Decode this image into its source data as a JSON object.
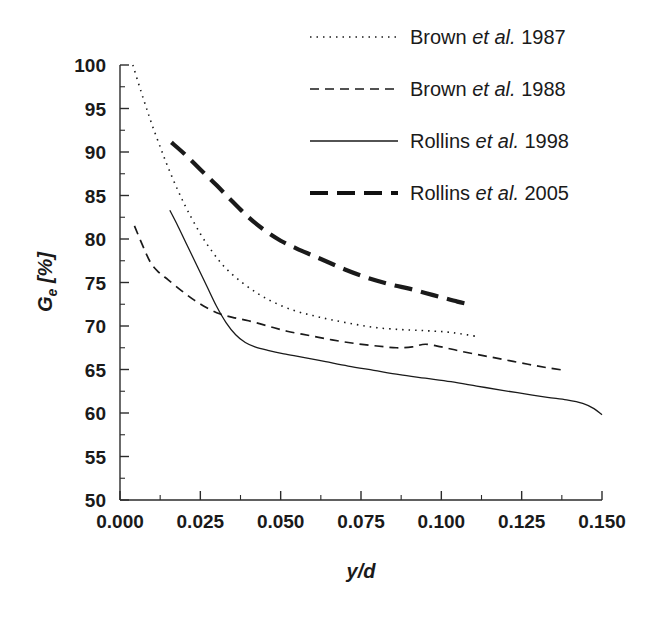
{
  "figure": {
    "width": 666,
    "height": 620,
    "background": "#ffffff",
    "ink_color": "#1a1a1a"
  },
  "chart_data": {
    "type": "line",
    "title": "",
    "subtitle": "",
    "xlabel": "y/d",
    "xlabel_parts": {
      "variable1": "y",
      "separator": "/",
      "variable2": "d"
    },
    "ylabel": "Ge [%]",
    "ylabel_parts": {
      "symbol": "G",
      "subscript": "e",
      "unit": "[%]"
    },
    "xlim": [
      0.0,
      0.15
    ],
    "ylim": [
      50,
      100
    ],
    "xticks": [
      0.0,
      0.025,
      0.05,
      0.075,
      0.1,
      0.125,
      0.15
    ],
    "xtick_labels": [
      "0.000",
      "0.025",
      "0.050",
      "0.075",
      "0.100",
      "0.125",
      "0.150"
    ],
    "x_minor_step": 0.0125,
    "yticks": [
      50,
      55,
      60,
      65,
      70,
      75,
      80,
      85,
      90,
      95,
      100
    ],
    "ytick_labels": [
      "50",
      "55",
      "60",
      "65",
      "70",
      "75",
      "80",
      "85",
      "90",
      "95",
      "100"
    ],
    "y_minor_step": 2.5,
    "grid": false,
    "legend_position": "top-right",
    "series": [
      {
        "name": "Brown et al. 1987",
        "label_prefix": "Brown ",
        "label_italic": "et al.",
        "label_suffix": " 1987",
        "style": "dotted",
        "color": "#1a1a1a",
        "width": 1.6,
        "dasharray": "1.5,5",
        "x": [
          0.004,
          0.006,
          0.008,
          0.01,
          0.0125,
          0.015,
          0.018,
          0.021,
          0.025,
          0.029,
          0.033,
          0.038,
          0.043,
          0.048,
          0.054,
          0.06,
          0.066,
          0.073,
          0.08,
          0.087,
          0.093,
          0.098,
          0.102,
          0.106,
          0.111
        ],
        "y": [
          100.0,
          97.6,
          95.3,
          93.1,
          90.6,
          88.2,
          85.6,
          83.3,
          80.6,
          78.4,
          76.6,
          75.0,
          73.7,
          72.7,
          71.8,
          71.2,
          70.7,
          70.2,
          69.8,
          69.6,
          69.5,
          69.4,
          69.3,
          69.1,
          68.8
        ]
      },
      {
        "name": "Brown et al. 1988",
        "label_prefix": "Brown ",
        "label_italic": "et al.",
        "label_suffix": " 1988",
        "style": "dashed",
        "color": "#1a1a1a",
        "width": 1.7,
        "dasharray": "9,6",
        "x": [
          0.0045,
          0.007,
          0.0095,
          0.012,
          0.015,
          0.019,
          0.023,
          0.027,
          0.031,
          0.035,
          0.04,
          0.046,
          0.052,
          0.059,
          0.066,
          0.073,
          0.08,
          0.086,
          0.091,
          0.095,
          0.1,
          0.106,
          0.113,
          0.12,
          0.127,
          0.133,
          0.1385
        ],
        "y": [
          81.5,
          79.3,
          77.3,
          76.2,
          75.3,
          74.1,
          73.0,
          72.1,
          71.4,
          71.0,
          70.6,
          70.0,
          69.4,
          68.9,
          68.4,
          68.0,
          67.7,
          67.5,
          67.6,
          67.9,
          67.6,
          67.1,
          66.6,
          66.1,
          65.6,
          65.2,
          64.9
        ]
      },
      {
        "name": "Rollins et al. 1998",
        "label_prefix": "Rollins ",
        "label_italic": "et al.",
        "label_suffix": " 1998",
        "style": "solid",
        "color": "#1a1a1a",
        "width": 1.3,
        "dasharray": "none",
        "x": [
          0.0155,
          0.018,
          0.021,
          0.024,
          0.027,
          0.03,
          0.033,
          0.036,
          0.039,
          0.042,
          0.046,
          0.051,
          0.057,
          0.064,
          0.071,
          0.079,
          0.087,
          0.095,
          0.103,
          0.111,
          0.119,
          0.126,
          0.133,
          0.139,
          0.144,
          0.1475,
          0.15
        ],
        "y": [
          83.3,
          81.5,
          79.2,
          76.9,
          74.6,
          72.3,
          70.4,
          69.0,
          68.1,
          67.6,
          67.2,
          66.8,
          66.4,
          65.9,
          65.4,
          64.9,
          64.4,
          64.0,
          63.6,
          63.1,
          62.6,
          62.2,
          61.8,
          61.5,
          61.1,
          60.5,
          59.8
        ]
      },
      {
        "name": "Rollins et al. 2005",
        "label_prefix": "Rollins ",
        "label_italic": "et al.",
        "label_suffix": " 2005",
        "style": "thick-dashed",
        "color": "#111111",
        "width": 4.2,
        "dasharray": "18,9",
        "x": [
          0.016,
          0.02,
          0.025,
          0.03,
          0.035,
          0.04,
          0.045,
          0.05,
          0.055,
          0.06,
          0.065,
          0.07,
          0.075,
          0.08,
          0.085,
          0.09,
          0.095,
          0.1,
          0.105,
          0.1085
        ],
        "y": [
          91.1,
          89.8,
          88.0,
          86.2,
          84.3,
          82.5,
          81.0,
          79.8,
          78.9,
          78.1,
          77.3,
          76.5,
          75.8,
          75.2,
          74.7,
          74.3,
          73.8,
          73.3,
          72.8,
          72.5
        ]
      }
    ]
  },
  "legend": {
    "entries": [
      {
        "label": "Brown et al. 1987",
        "sample": "dotted"
      },
      {
        "label": "Brown et al. 1988",
        "sample": "dashed"
      },
      {
        "label": "Rollins et al. 1998",
        "sample": "solid"
      },
      {
        "label": "Rollins et al. 2005",
        "sample": "thick-dashed"
      }
    ]
  }
}
